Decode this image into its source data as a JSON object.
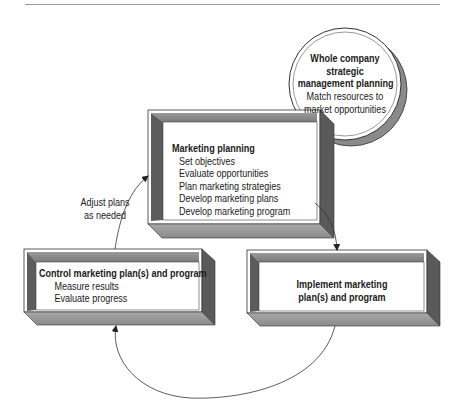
{
  "diagram": {
    "type": "flow-cycle",
    "nodes": {
      "strategic": {
        "title_lines": [
          "Whole company",
          "strategic",
          "management planning"
        ],
        "items": [
          "Match resources to",
          "market opportunities"
        ],
        "shape": "circle"
      },
      "planning": {
        "title": "Marketing planning",
        "items": [
          "Set objectives",
          "Evaluate opportunities",
          "Plan marketing strategies",
          "Develop marketing plans",
          "Develop marketing program"
        ],
        "shape": "3d-box"
      },
      "implement": {
        "title_lines": [
          "Implement marketing",
          "plan(s) and program"
        ],
        "shape": "3d-box"
      },
      "control": {
        "title": "Control marketing plan(s) and program",
        "items": [
          "Measure results",
          "Evaluate progress"
        ],
        "shape": "3d-box"
      }
    },
    "edges": [
      {
        "from": "planning",
        "to": "implement",
        "label": ""
      },
      {
        "from": "implement",
        "to": "control",
        "label": ""
      },
      {
        "from": "control",
        "to": "planning",
        "label": "Adjust plans as needed"
      }
    ],
    "edge_label_lines": [
      "Adjust plans",
      "as needed"
    ],
    "colors": {
      "box_frame": "#8c8c8c",
      "box_side_dark": "#5e5e5e",
      "box_bottom": "#9e9e9e",
      "panel": "#ffffff",
      "stroke": "#222222"
    }
  }
}
